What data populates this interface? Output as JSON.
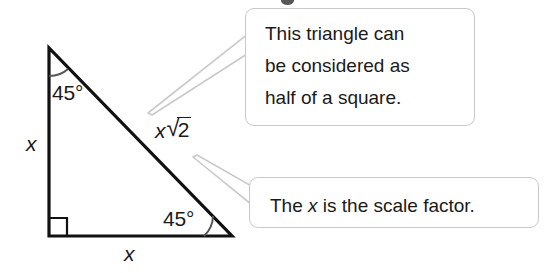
{
  "figure": {
    "type": "geometry-diagram",
    "shape": "right-isosceles-triangle",
    "triangle": {
      "vertices": {
        "apex": [
          49,
          48
        ],
        "bottom_left": [
          49,
          236
        ],
        "bottom_right": [
          232,
          236
        ]
      },
      "stroke_color": "#111111",
      "stroke_width": 3.2
    },
    "labels": {
      "angle_top": "45°",
      "angle_bottom_right": "45°",
      "leg_vertical": "x",
      "leg_horizontal": "x",
      "hypotenuse_variable": "x",
      "hypotenuse_radical_sign": "√",
      "hypotenuse_radicand": "2",
      "right_angle_marker": "square"
    }
  },
  "callouts": [
    {
      "id": "half-of-square",
      "lines": [
        "This triangle can",
        "be considered as",
        "half of a square."
      ],
      "points_at": "hypotenuse",
      "border_color": "#c9c9c9"
    },
    {
      "id": "scale-factor",
      "text_before": "The ",
      "variable": "x",
      "text_after": " is the scale factor.",
      "points_at": "hypotenuse-lower",
      "border_color": "#c9c9c9"
    }
  ]
}
